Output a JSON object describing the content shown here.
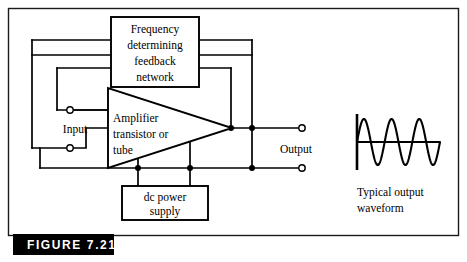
{
  "figure": {
    "tag_label": "FIGURE 7.21",
    "tag_bg_color": "#000000",
    "tag_text_color": "#ffffff"
  },
  "blocks": {
    "feedback_network": {
      "lines": [
        "Frequency",
        "determining",
        "feedback",
        "network"
      ]
    },
    "amplifier": {
      "lines": [
        "Amplifier",
        "transistor or",
        "tube"
      ]
    },
    "power_supply": {
      "lines": [
        "dc power",
        "supply"
      ]
    }
  },
  "ports": {
    "input_label": "Input",
    "output_label": "Output"
  },
  "waveform": {
    "caption_lines": [
      "Typical output",
      "waveform"
    ],
    "cycles": 3,
    "amplitude_px": 23,
    "baseline_y": 142,
    "x_start": 357,
    "x_end": 440,
    "stroke_color": "#000000"
  },
  "colors": {
    "ink": "#000000",
    "paper": "#ffffff",
    "frame": "#1a1a1a"
  }
}
